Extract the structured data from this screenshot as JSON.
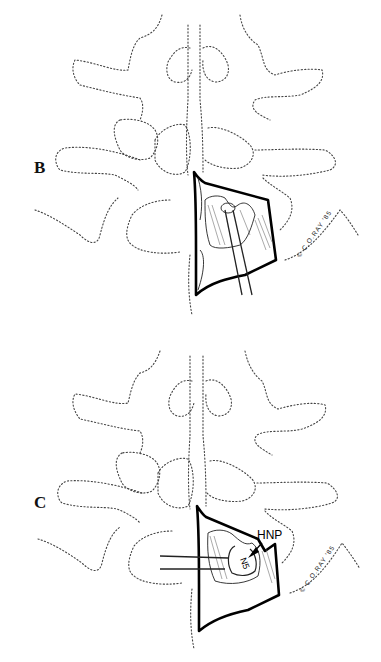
{
  "figure": {
    "panels": [
      {
        "id": "B",
        "label": "B",
        "copyright": "© C.O.RAY '85"
      },
      {
        "id": "C",
        "label": "C",
        "copyright": "© C.O.RAY '85",
        "annotations": {
          "hnp": "HNP",
          "nerve_root": "N5"
        }
      }
    ],
    "colors": {
      "line": "#000000",
      "dotted_outline": "#444444",
      "background": "#ffffff"
    }
  }
}
